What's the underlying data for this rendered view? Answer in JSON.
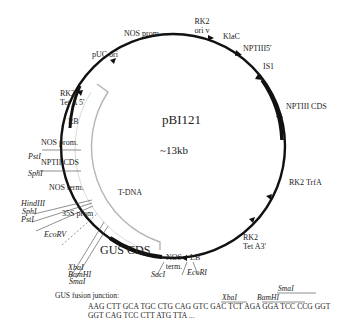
{
  "plasmid": {
    "name": "pBI121",
    "size": "~13kb",
    "region_label": "T-DNA",
    "colors": {
      "backbone": "#111111",
      "tdna_arc": "#b5b5b5",
      "leader": "#444444"
    }
  },
  "features": {
    "rk2_oriv": [
      "RK2",
      "ori v"
    ],
    "klac": "KlaC",
    "nptiii5": "NPTIII5'",
    "is1": "IS1",
    "nptiii_cds": "NPTIII CDS",
    "rk2_trfa": "RK2 TrfA",
    "rk2_teta3": [
      "RK2",
      "Tet A3'"
    ],
    "nos_prom_top": "NOS prom.",
    "puc_ori": "pUC ori",
    "rk2_teta5": [
      "RK2",
      "Tet A 5'"
    ],
    "rb": "RB",
    "nos_prom": "NOS prom.",
    "nptii_cds": "NPTII CDS",
    "nos_term_left": "NOS term.",
    "promoter_35s": "35S prom",
    "gus_cds": "GUS CDS",
    "nos_term_bottom": [
      "NOS",
      "term."
    ],
    "lb": "LB"
  },
  "restriction_sites": {
    "psti_upper": "PstI",
    "sphi": "SphI",
    "hindiii": "HindIII",
    "sphi_2": "SphI",
    "psti_lower": "PstI",
    "ecorv": "EcoRV",
    "xbai": "XbaI",
    "bamhi": "BamHI",
    "smai": "SmaI",
    "saci": "SacI",
    "ecori": "EcoRI"
  },
  "fusion_junction": {
    "title": "GUS fusion junction:",
    "line1": "AAG CTT  GCA  TGC CTG  CAG GTC  GAC TCT AGA  GGA TCC  CCG GGT",
    "line2": "GGT CAG TCC  CTT  ATG  TTA ...",
    "site_xbai": "XbaI",
    "site_bamhi": "BamHI",
    "site_smai": "SmaI"
  }
}
